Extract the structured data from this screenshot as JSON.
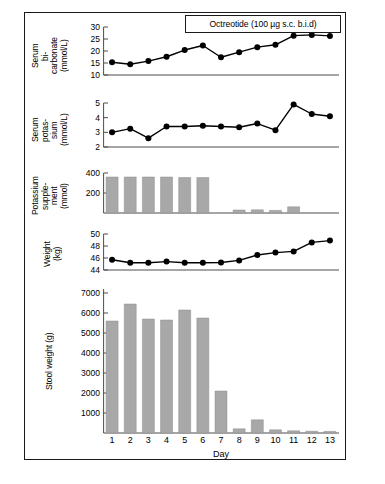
{
  "figure": {
    "annotation": "Octreotide (100 µg s.c. b.i.d)",
    "x_axis_label": "Day",
    "day_labels": [
      "1",
      "2",
      "3",
      "4",
      "5",
      "6",
      "7",
      "8",
      "9",
      "10",
      "11",
      "12",
      "13"
    ],
    "colors": {
      "frame": "#1a1a1a",
      "line": "#000000",
      "marker": "#000000",
      "bar": "#a8a8a8",
      "bar_edge": "#8f8f8f",
      "axis": "#4d4d4d"
    }
  },
  "chart_data": [
    {
      "type": "line",
      "panel": "serum-bicarbonate",
      "title": "",
      "ylabel": "Serum\nbi-\ncarbonate\n(mmol/L)",
      "ylabel_parts": [
        "Serum",
        "bi-",
        "carbonate",
        "(mmol/L)"
      ],
      "xlabel": "Day",
      "x": [
        1,
        2,
        3,
        4,
        5,
        6,
        7,
        8,
        9,
        10,
        11,
        12,
        13
      ],
      "values": [
        15.3,
        14.5,
        15.8,
        17.6,
        20.4,
        22.3,
        17.4,
        19.5,
        21.6,
        22.6,
        26.4,
        26.7,
        26.3
      ],
      "ylim": [
        10,
        30
      ],
      "yticks": [
        10,
        15,
        20,
        25,
        30
      ],
      "ytick_labels": [
        "10",
        "15",
        "20",
        "25",
        "30"
      ],
      "grid": false,
      "legend": "none"
    },
    {
      "type": "line",
      "panel": "serum-potassium",
      "title": "",
      "ylabel": "Serum\npotas-\nsium\n(mmol/L)",
      "ylabel_parts": [
        "Serum",
        "potas-",
        "sium",
        "(mmol/L)"
      ],
      "xlabel": "Day",
      "x": [
        1,
        2,
        3,
        4,
        5,
        6,
        7,
        8,
        9,
        10,
        11,
        12,
        13
      ],
      "values": [
        3.0,
        3.25,
        2.6,
        3.4,
        3.4,
        3.45,
        3.4,
        3.35,
        3.6,
        3.15,
        4.9,
        4.25,
        4.1
      ],
      "ylim": [
        2,
        5
      ],
      "yticks": [
        2,
        3,
        4,
        5
      ],
      "ytick_labels": [
        "2",
        "3",
        "4",
        "5"
      ],
      "grid": false,
      "legend": "none"
    },
    {
      "type": "bar",
      "panel": "potassium-supplement",
      "title": "",
      "ylabel": "Potassium\nsupple-\nment\n(mmol)",
      "ylabel_parts": [
        "Potassium",
        "supple-",
        "ment",
        "(mmol)"
      ],
      "xlabel": "Day",
      "categories": [
        "1",
        "2",
        "3",
        "4",
        "5",
        "6",
        "7",
        "8",
        "9",
        "10",
        "11",
        "12",
        "13"
      ],
      "values": [
        360,
        360,
        360,
        360,
        355,
        355,
        0,
        30,
        32,
        26,
        62,
        0,
        0
      ],
      "ylim": [
        0,
        400
      ],
      "yticks": [
        200,
        400
      ],
      "ytick_labels": [
        "200",
        "400"
      ],
      "grid": false,
      "legend": "none"
    },
    {
      "type": "line",
      "panel": "weight",
      "title": "",
      "ylabel": "Weight\n(kg)",
      "ylabel_parts": [
        "Weight",
        "(kg)"
      ],
      "xlabel": "Day",
      "x": [
        1,
        2,
        3,
        4,
        5,
        6,
        7,
        8,
        9,
        10,
        11,
        12,
        13
      ],
      "values": [
        45.7,
        45.2,
        45.2,
        45.4,
        45.2,
        45.2,
        45.25,
        45.6,
        46.5,
        46.9,
        47.1,
        48.6,
        48.9
      ],
      "ylim": [
        44,
        50
      ],
      "yticks": [
        44,
        46,
        48,
        50
      ],
      "ytick_labels": [
        "44",
        "46",
        "48",
        "50"
      ],
      "grid": false,
      "legend": "none"
    },
    {
      "type": "bar",
      "panel": "stool-weight",
      "title": "",
      "ylabel": "Stool weight (g)",
      "ylabel_parts": [
        "Stool weight (g)"
      ],
      "xlabel": "Day",
      "categories": [
        "1",
        "2",
        "3",
        "4",
        "5",
        "6",
        "7",
        "8",
        "9",
        "10",
        "11",
        "12",
        "13"
      ],
      "values": [
        5600,
        6450,
        5700,
        5650,
        6150,
        5750,
        2100,
        210,
        660,
        160,
        110,
        90,
        80
      ],
      "ylim": [
        0,
        7200
      ],
      "yticks": [
        1000,
        2000,
        3000,
        4000,
        5000,
        6000,
        7000
      ],
      "ytick_labels": [
        "1000",
        "2000",
        "3000",
        "4000",
        "5000",
        "6000",
        "7000"
      ],
      "grid": false,
      "legend": "none"
    }
  ]
}
